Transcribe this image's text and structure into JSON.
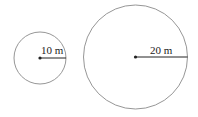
{
  "diagram": {
    "circles": [
      {
        "id": "small",
        "cx": 40,
        "cy": 58,
        "r": 26,
        "radius_label": "10 m"
      },
      {
        "id": "large",
        "cx": 135.5,
        "cy": 57,
        "r": 52,
        "radius_label": "20 m"
      }
    ],
    "stroke_color": "#8a8a8a",
    "radius_color": "#222222"
  }
}
